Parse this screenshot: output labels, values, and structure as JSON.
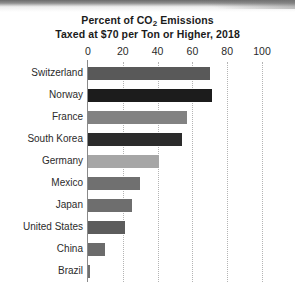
{
  "chart_data": {
    "type": "bar",
    "orientation": "horizontal",
    "title": "Percent of CO2 Emissions Taxed at $70 per Ton or Higher, 2018",
    "title_lines": [
      "Percent of CO",
      "2",
      " Emissions",
      "Taxed at $70 per Ton or Higher, 2018"
    ],
    "title_line_1_pre": "Percent of CO",
    "title_line_1_sub": "2",
    "title_line_1_post": " Emissions",
    "title_line_2": "Taxed at $70 per Ton or Higher, 2018",
    "xlabel": "",
    "ylabel": "",
    "xlim": [
      0,
      100
    ],
    "xticks": [
      0,
      20,
      40,
      60,
      80,
      100
    ],
    "xtick_labels": [
      "0",
      "20",
      "40",
      "60",
      "80",
      "100"
    ],
    "grid": "vertical-dotted",
    "legend": "none",
    "axis_position": "top",
    "categories": [
      "Switzerland",
      "Norway",
      "France",
      "South Korea",
      "Germany",
      "Mexico",
      "Japan",
      "United States",
      "China",
      "Brazil"
    ],
    "values": [
      70,
      71,
      57,
      54,
      41,
      30,
      25,
      21,
      10,
      1
    ],
    "bars": [
      {
        "label": "Switzerland",
        "value": 70,
        "color": "#595959"
      },
      {
        "label": "Norway",
        "value": 71,
        "color": "#1c1c1c"
      },
      {
        "label": "France",
        "value": 57,
        "color": "#828282"
      },
      {
        "label": "South Korea",
        "value": 54,
        "color": "#2b2b2b"
      },
      {
        "label": "Germany",
        "value": 41,
        "color": "#a6a6a6"
      },
      {
        "label": "Mexico",
        "value": 30,
        "color": "#707070"
      },
      {
        "label": "Japan",
        "value": 25,
        "color": "#6e6e6e"
      },
      {
        "label": "United States",
        "value": 21,
        "color": "#5c5c5c"
      },
      {
        "label": "China",
        "value": 10,
        "color": "#6b6b6b"
      },
      {
        "label": "Brazil",
        "value": 1,
        "color": "#6f6f6f"
      }
    ],
    "colors": {
      "background": "#ffffff",
      "axis": "#8a8a8a",
      "gridline": "#b4b4b4",
      "text": "#2b2b2b",
      "title": "#1b1b1b"
    }
  }
}
